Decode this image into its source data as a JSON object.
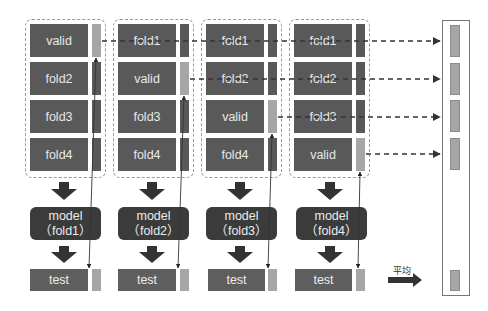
{
  "diagram": {
    "colors": {
      "fold_block": "#595959",
      "valid_bar": "#a6a6a6",
      "model_box": "#3b3b3b",
      "group_border": "#9a9a9a"
    },
    "folds": [
      {
        "rows": [
          "valid",
          "fold2",
          "fold3",
          "fold4"
        ],
        "valid_index": 0,
        "model_line1": "model",
        "model_line2": "（fold1）",
        "test_label": "test"
      },
      {
        "rows": [
          "fold1",
          "valid",
          "fold3",
          "fold4"
        ],
        "valid_index": 1,
        "model_line1": "model",
        "model_line2": "（fold2）",
        "test_label": "test"
      },
      {
        "rows": [
          "fold1",
          "fold2",
          "valid",
          "fold4"
        ],
        "valid_index": 2,
        "model_line1": "model",
        "model_line2": "（fold3）",
        "test_label": "test"
      },
      {
        "rows": [
          "fold1",
          "fold2",
          "fold3",
          "valid"
        ],
        "valid_index": 3,
        "model_line1": "model",
        "model_line2": "（fold4）",
        "test_label": "test"
      }
    ],
    "average_label": "平均",
    "result_bars": 5
  }
}
